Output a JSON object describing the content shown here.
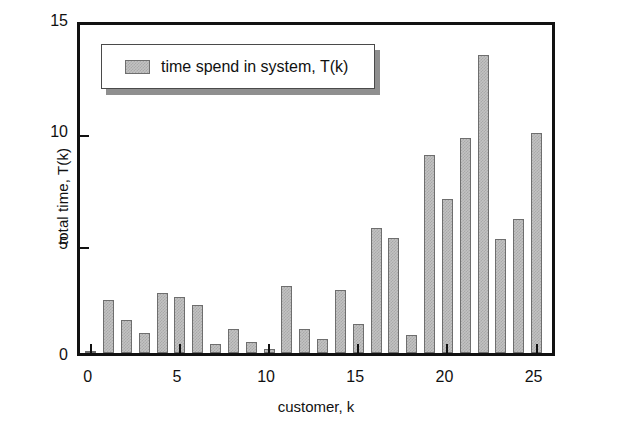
{
  "chart_data": {
    "type": "bar",
    "title": "",
    "xlabel": "customer, k",
    "ylabel": "total time, T(k)",
    "legend": [
      {
        "label": "time spend in system, T(k)",
        "color": "#c2c2c2"
      }
    ],
    "legend_position": "top-left-inside",
    "grid": false,
    "xlim": [
      -0.6,
      26.2
    ],
    "ylim": [
      0,
      15
    ],
    "xticks": [
      0,
      5,
      10,
      15,
      20,
      25
    ],
    "xtick_labels": [
      "0",
      "5",
      "10",
      "15",
      "20",
      "25"
    ],
    "yticks": [
      0,
      5,
      10,
      15
    ],
    "ytick_labels": [
      "0",
      "5",
      "10",
      "15"
    ],
    "categories": [
      0,
      1,
      2,
      3,
      4,
      5,
      6,
      7,
      8,
      9,
      10,
      11,
      12,
      13,
      14,
      15,
      16,
      17,
      18,
      19,
      20,
      21,
      22,
      23,
      24,
      25
    ],
    "values": [
      0.1,
      2.4,
      1.5,
      0.9,
      2.7,
      2.5,
      2.15,
      0.4,
      1.1,
      0.5,
      0.2,
      3.0,
      1.1,
      0.65,
      2.85,
      1.3,
      5.6,
      5.15,
      0.8,
      8.9,
      6.9,
      9.65,
      13.4,
      5.1,
      6.0,
      9.9
    ],
    "series": [
      {
        "name": "time spend in system, T(k)",
        "values": [
          0.1,
          2.4,
          1.5,
          0.9,
          2.7,
          2.5,
          2.15,
          0.4,
          1.1,
          0.5,
          0.2,
          3.0,
          1.1,
          0.65,
          2.85,
          1.3,
          5.6,
          5.15,
          0.8,
          8.9,
          6.9,
          9.65,
          13.4,
          5.1,
          6.0,
          9.9
        ]
      }
    ],
    "bar_fill_color": "#c2c2c2",
    "bar_edge_color": "#6e6e6e",
    "axis_color": "#111111"
  }
}
